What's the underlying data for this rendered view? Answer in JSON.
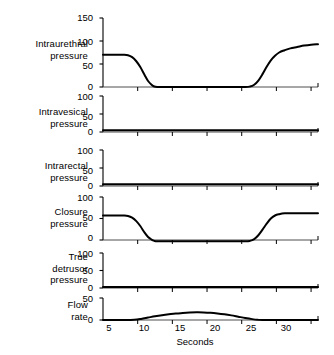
{
  "figure": {
    "title": "",
    "background_color": "#ffffff",
    "line_color": "#000000",
    "axis_color": "#000000"
  },
  "axis": {
    "xlabel": "Seconds",
    "xticks": [
      5,
      10,
      15,
      20,
      25,
      30
    ],
    "xtick_labels": [
      "5",
      "10",
      "15",
      "20",
      "25",
      "30"
    ],
    "xlim": [
      0,
      31
    ]
  },
  "chart_data": {
    "type": "line",
    "title": "",
    "xlabel": "Seconds",
    "ylabel": "",
    "grid": false,
    "legend": "none",
    "x_unit": "seconds",
    "xlim": [
      0,
      31
    ],
    "xticks": [
      5,
      10,
      15,
      20,
      25,
      30
    ],
    "panels": [
      {
        "label": "Intraurethral\npressure",
        "label_lines": [
          "Intraurethral",
          "pressure"
        ],
        "yticks": [
          0,
          50,
          100,
          150
        ],
        "ytick_labels": [
          "0",
          "50",
          "100",
          "150"
        ],
        "ylim": [
          0,
          150
        ],
        "series": [
          {
            "name": "Intraurethral pressure",
            "points": [
              [
                0,
                70
              ],
              [
                1,
                70
              ],
              [
                2,
                70
              ],
              [
                3,
                70
              ],
              [
                3.6,
                69
              ],
              [
                4.2,
                65
              ],
              [
                4.8,
                56
              ],
              [
                5.4,
                43
              ],
              [
                6.0,
                26
              ],
              [
                6.5,
                13
              ],
              [
                7.0,
                5
              ],
              [
                7.4,
                1
              ],
              [
                7.8,
                0
              ],
              [
                9,
                0
              ],
              [
                12,
                0
              ],
              [
                15,
                0
              ],
              [
                18,
                0
              ],
              [
                20.5,
                0
              ],
              [
                21.2,
                1
              ],
              [
                21.8,
                5
              ],
              [
                22.4,
                14
              ],
              [
                23.0,
                28
              ],
              [
                23.6,
                44
              ],
              [
                24.2,
                58
              ],
              [
                24.8,
                68
              ],
              [
                25.4,
                75
              ],
              [
                26.2,
                80
              ],
              [
                27.0,
                84
              ],
              [
                28.0,
                87
              ],
              [
                29.0,
                90
              ],
              [
                30.0,
                92
              ],
              [
                31.0,
                93
              ]
            ]
          }
        ]
      },
      {
        "label": "Intravesical\npressure",
        "label_lines": [
          "Intravesical",
          "pressure"
        ],
        "yticks": [
          0,
          50,
          100
        ],
        "ytick_labels": [
          "0",
          "50",
          "100"
        ],
        "ylim": [
          0,
          100
        ],
        "series": [
          {
            "name": "Intravesical pressure",
            "points": [
              [
                0,
                5
              ],
              [
                5,
                5
              ],
              [
                10,
                5
              ],
              [
                15,
                5
              ],
              [
                20,
                5
              ],
              [
                25,
                5
              ],
              [
                31,
                5
              ]
            ]
          }
        ]
      },
      {
        "label": "Intrarectal\npressure",
        "label_lines": [
          "Intrarectal",
          "pressure"
        ],
        "yticks": [
          0,
          50,
          100
        ],
        "ytick_labels": [
          "0",
          "50",
          "100"
        ],
        "ylim": [
          0,
          100
        ],
        "series": [
          {
            "name": "Intrarectal pressure",
            "points": [
              [
                0,
                5
              ],
              [
                5,
                5
              ],
              [
                10,
                5
              ],
              [
                15,
                5
              ],
              [
                20,
                5
              ],
              [
                25,
                5
              ],
              [
                31,
                5
              ]
            ]
          }
        ]
      },
      {
        "label": "Closure\npressure",
        "label_lines": [
          "Closure",
          "pressure"
        ],
        "yticks": [
          0,
          50,
          100
        ],
        "ytick_labels": [
          "0",
          "50",
          "100"
        ],
        "ylim": [
          -8,
          100
        ],
        "series": [
          {
            "name": "Closure pressure",
            "points": [
              [
                0,
                57
              ],
              [
                1,
                57
              ],
              [
                2,
                57
              ],
              [
                3,
                57
              ],
              [
                3.6,
                56
              ],
              [
                4.2,
                52
              ],
              [
                4.8,
                44
              ],
              [
                5.4,
                32
              ],
              [
                6.0,
                17
              ],
              [
                6.5,
                7
              ],
              [
                7.0,
                1
              ],
              [
                7.4,
                -2
              ],
              [
                7.8,
                -3
              ],
              [
                9,
                -3
              ],
              [
                12,
                -3
              ],
              [
                15,
                -3
              ],
              [
                18,
                -3
              ],
              [
                20.5,
                -3
              ],
              [
                21.2,
                -2
              ],
              [
                21.8,
                2
              ],
              [
                22.4,
                11
              ],
              [
                23.0,
                24
              ],
              [
                23.6,
                38
              ],
              [
                24.2,
                50
              ],
              [
                24.8,
                57
              ],
              [
                25.4,
                60
              ],
              [
                26.2,
                62
              ],
              [
                27.0,
                62
              ],
              [
                28.0,
                62
              ],
              [
                29.0,
                62
              ],
              [
                30.0,
                62
              ],
              [
                31.0,
                62
              ]
            ]
          }
        ]
      },
      {
        "label": "True\ndetrusor\npressure",
        "label_lines": [
          "True",
          "detrusor",
          "pressure"
        ],
        "yticks": [
          0,
          50,
          100
        ],
        "ytick_labels": [
          "0",
          "50",
          "100"
        ],
        "ylim": [
          0,
          100
        ],
        "series": [
          {
            "name": "True detrusor pressure",
            "points": [
              [
                0,
                3
              ],
              [
                5,
                3
              ],
              [
                10,
                3
              ],
              [
                15,
                3
              ],
              [
                20,
                3
              ],
              [
                25,
                3
              ],
              [
                31,
                3
              ]
            ]
          }
        ]
      },
      {
        "label": "Flow\nrate",
        "label_lines": [
          "Flow",
          "rate"
        ],
        "yticks": [
          0,
          50
        ],
        "ytick_labels": [
          "0",
          "50"
        ],
        "ylim": [
          0,
          50
        ],
        "series": [
          {
            "name": "Flow rate",
            "points": [
              [
                0,
                0
              ],
              [
                3,
                0
              ],
              [
                4.5,
                0.5
              ],
              [
                5.5,
                2.5
              ],
              [
                6.5,
                5.5
              ],
              [
                7.5,
                8.5
              ],
              [
                8.5,
                11
              ],
              [
                9.5,
                13
              ],
              [
                10.5,
                14.5
              ],
              [
                11.5,
                16
              ],
              [
                12.5,
                17
              ],
              [
                13.5,
                17.5
              ],
              [
                14.5,
                17.3
              ],
              [
                15.5,
                16.5
              ],
              [
                16.5,
                15
              ],
              [
                17.5,
                13
              ],
              [
                18.5,
                10.5
              ],
              [
                19.5,
                7.5
              ],
              [
                20.5,
                4.5
              ],
              [
                21.5,
                2
              ],
              [
                22.3,
                0.5
              ],
              [
                23,
                0
              ],
              [
                26,
                0
              ],
              [
                31,
                0
              ]
            ]
          }
        ]
      }
    ]
  }
}
